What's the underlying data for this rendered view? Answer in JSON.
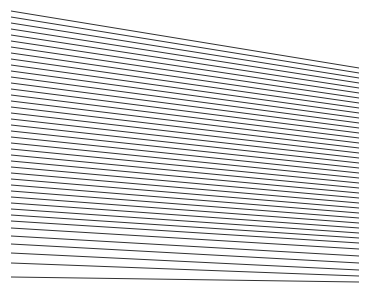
{
  "figure": {
    "type": "line-art",
    "canvas": {
      "width": 371,
      "height": 288,
      "background_color": "#ffffff"
    },
    "style": {
      "stroke_color": "#1a1a1a",
      "stroke_width": 0.9,
      "line_cap": "butt",
      "antialias": true
    },
    "anchors": {
      "left_x": 11,
      "left_y_top": 11,
      "left_y_bottom": 277,
      "right_x": 359,
      "right_y_top": 68,
      "right_y_bottom": 282
    },
    "counts": {
      "total_lines": 42,
      "left_endpoints": 42,
      "right_endpoints": 42
    },
    "chart_data": {
      "type": "line",
      "title": "Fan of straight line segments",
      "xlabel": "",
      "ylabel": "",
      "xlim": [
        0,
        371
      ],
      "ylim": [
        0,
        288
      ],
      "grid": false,
      "legend": "none",
      "segments": [
        {
          "x1": 11,
          "y1": 11,
          "x2": 359,
          "y2": 68
        },
        {
          "x1": 11,
          "y1": 17,
          "x2": 359,
          "y2": 73
        },
        {
          "x1": 11,
          "y1": 23,
          "x2": 359,
          "y2": 78
        },
        {
          "x1": 11,
          "y1": 29,
          "x2": 359,
          "y2": 83
        },
        {
          "x1": 11,
          "y1": 35,
          "x2": 359,
          "y2": 88
        },
        {
          "x1": 11,
          "y1": 41,
          "x2": 359,
          "y2": 93
        },
        {
          "x1": 11,
          "y1": 47,
          "x2": 359,
          "y2": 98
        },
        {
          "x1": 11,
          "y1": 53,
          "x2": 359,
          "y2": 103
        },
        {
          "x1": 11,
          "y1": 59,
          "x2": 359,
          "y2": 108
        },
        {
          "x1": 11,
          "y1": 65,
          "x2": 359,
          "y2": 113
        },
        {
          "x1": 11,
          "y1": 71,
          "x2": 359,
          "y2": 118
        },
        {
          "x1": 11,
          "y1": 77,
          "x2": 359,
          "y2": 123
        },
        {
          "x1": 11,
          "y1": 83,
          "x2": 359,
          "y2": 128
        },
        {
          "x1": 11,
          "y1": 89,
          "x2": 359,
          "y2": 133
        },
        {
          "x1": 11,
          "y1": 95,
          "x2": 359,
          "y2": 138
        },
        {
          "x1": 11,
          "y1": 101,
          "x2": 359,
          "y2": 143
        },
        {
          "x1": 11,
          "y1": 107,
          "x2": 359,
          "y2": 148
        },
        {
          "x1": 11,
          "y1": 113,
          "x2": 359,
          "y2": 153
        },
        {
          "x1": 11,
          "y1": 119,
          "x2": 359,
          "y2": 158
        },
        {
          "x1": 11,
          "y1": 125,
          "x2": 359,
          "y2": 163
        },
        {
          "x1": 11,
          "y1": 131,
          "x2": 359,
          "y2": 168
        },
        {
          "x1": 11,
          "y1": 137,
          "x2": 359,
          "y2": 173
        },
        {
          "x1": 11,
          "y1": 143,
          "x2": 359,
          "y2": 178
        },
        {
          "x1": 11,
          "y1": 149,
          "x2": 359,
          "y2": 183
        },
        {
          "x1": 11,
          "y1": 155,
          "x2": 359,
          "y2": 188
        },
        {
          "x1": 11,
          "y1": 161,
          "x2": 359,
          "y2": 193
        },
        {
          "x1": 11,
          "y1": 167,
          "x2": 359,
          "y2": 198
        },
        {
          "x1": 11,
          "y1": 173,
          "x2": 359,
          "y2": 203
        },
        {
          "x1": 11,
          "y1": 179,
          "x2": 359,
          "y2": 208
        },
        {
          "x1": 11,
          "y1": 185,
          "x2": 359,
          "y2": 213
        },
        {
          "x1": 11,
          "y1": 191,
          "x2": 359,
          "y2": 218
        },
        {
          "x1": 11,
          "y1": 197,
          "x2": 359,
          "y2": 223
        },
        {
          "x1": 11,
          "y1": 203,
          "x2": 359,
          "y2": 228
        },
        {
          "x1": 11,
          "y1": 209,
          "x2": 359,
          "y2": 233
        },
        {
          "x1": 11,
          "y1": 215,
          "x2": 359,
          "y2": 238
        },
        {
          "x1": 11,
          "y1": 221,
          "x2": 359,
          "y2": 243
        },
        {
          "x1": 11,
          "y1": 228,
          "x2": 359,
          "y2": 249
        },
        {
          "x1": 11,
          "y1": 236,
          "x2": 359,
          "y2": 256
        },
        {
          "x1": 11,
          "y1": 244,
          "x2": 359,
          "y2": 263
        },
        {
          "x1": 11,
          "y1": 253,
          "x2": 359,
          "y2": 270
        },
        {
          "x1": 11,
          "y1": 263,
          "x2": 359,
          "y2": 276
        },
        {
          "x1": 11,
          "y1": 277,
          "x2": 359,
          "y2": 282
        }
      ]
    }
  }
}
